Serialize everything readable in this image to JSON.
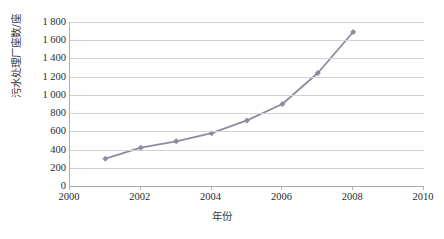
{
  "chart_data": {
    "type": "line",
    "title": "",
    "xlabel": "年份",
    "ylabel": "污水处理厂座数/座",
    "xlim": [
      2000,
      2010
    ],
    "ylim": [
      0,
      1800
    ],
    "xticks": [
      "2000",
      "2002",
      "2004",
      "2006",
      "2008",
      "2010"
    ],
    "xtick_values": [
      2000,
      2002,
      2004,
      2006,
      2008,
      2010
    ],
    "yticks": [
      "0",
      "200",
      "400",
      "600",
      "800",
      "1 000",
      "1 200",
      "1 400",
      "1 600",
      "1 800"
    ],
    "ytick_values": [
      0,
      200,
      400,
      600,
      800,
      1000,
      1200,
      1400,
      1600,
      1800
    ],
    "grid": "horizontal",
    "legend": "none",
    "series": [
      {
        "name": "污水处理厂座数",
        "color": "#8c8c9e",
        "marker": "diamond",
        "x": [
          2001,
          2002,
          2003,
          2004,
          2005,
          2006,
          2007,
          2008
        ],
        "values": [
          300,
          420,
          490,
          580,
          720,
          900,
          1240,
          1690
        ]
      }
    ]
  }
}
